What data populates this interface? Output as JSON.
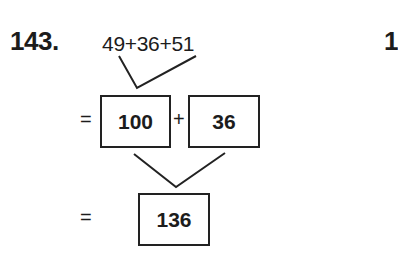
{
  "problem": {
    "number": "143.",
    "expression": "49+36+51",
    "step1": {
      "equals": "=",
      "left_box": "100",
      "operator": "+",
      "right_box": "36"
    },
    "step2": {
      "equals": "=",
      "result_box": "136"
    }
  },
  "next_problem": {
    "number_partial": "1"
  }
}
